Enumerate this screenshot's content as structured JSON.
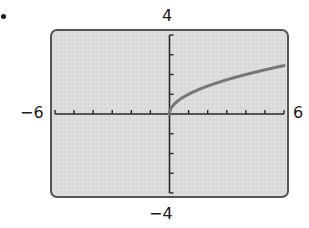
{
  "chart_data": {
    "type": "line",
    "title": "",
    "xlabel": "",
    "ylabel": "",
    "xlim": [
      -6,
      6
    ],
    "ylim": [
      -4,
      4
    ],
    "x_tick_step": 1,
    "y_tick_step": 1,
    "grid": false,
    "window_labels": {
      "xmin": "−6",
      "xmax": "6",
      "ymin": "−4",
      "ymax": "4"
    },
    "series": [
      {
        "name": "y = √x",
        "x": [
          0,
          0.25,
          0.5,
          1,
          1.5,
          2,
          2.5,
          3,
          3.5,
          4,
          4.5,
          5,
          5.5,
          6
        ],
        "y": [
          0,
          0.5,
          0.707,
          1,
          1.225,
          1.414,
          1.581,
          1.732,
          1.871,
          2,
          2.121,
          2.236,
          2.345,
          2.449
        ]
      }
    ]
  },
  "colors": {
    "screen_fill": "#dcdcdc",
    "frame": "#555555",
    "axis": "#2a2a2a",
    "curve": "#777777"
  }
}
